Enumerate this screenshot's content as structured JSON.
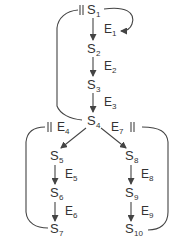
{
  "diagram": {
    "colors": {
      "stroke": "#444444",
      "text": "#333333",
      "background": "#ffffff"
    },
    "states": [
      {
        "id": "S1",
        "base": "S",
        "sub": "1",
        "x": 87,
        "y": 14
      },
      {
        "id": "S2",
        "base": "S",
        "sub": "2",
        "x": 87,
        "y": 53
      },
      {
        "id": "S3",
        "base": "S",
        "sub": "3",
        "x": 87,
        "y": 89
      },
      {
        "id": "S4",
        "base": "S",
        "sub": "4",
        "x": 87,
        "y": 125
      },
      {
        "id": "S5",
        "base": "S",
        "sub": "5",
        "x": 50,
        "y": 160
      },
      {
        "id": "S6",
        "base": "S",
        "sub": "6",
        "x": 50,
        "y": 197
      },
      {
        "id": "S7",
        "base": "S",
        "sub": "7",
        "x": 50,
        "y": 233
      },
      {
        "id": "S8",
        "base": "S",
        "sub": "8",
        "x": 125,
        "y": 160
      },
      {
        "id": "S9",
        "base": "S",
        "sub": "9",
        "x": 125,
        "y": 197
      },
      {
        "id": "S10",
        "base": "S",
        "sub": "10",
        "x": 125,
        "y": 233
      }
    ],
    "events": [
      {
        "id": "E1",
        "base": "E",
        "sub": "1",
        "x": 104,
        "y": 33
      },
      {
        "id": "E2",
        "base": "E",
        "sub": "2",
        "x": 104,
        "y": 70
      },
      {
        "id": "E3",
        "base": "E",
        "sub": "3",
        "x": 104,
        "y": 106
      },
      {
        "id": "E4",
        "base": "E",
        "sub": "4",
        "x": 57,
        "y": 131
      },
      {
        "id": "E5",
        "base": "E",
        "sub": "5",
        "x": 65,
        "y": 178
      },
      {
        "id": "E6",
        "base": "E",
        "sub": "6",
        "x": 65,
        "y": 215
      },
      {
        "id": "E7",
        "base": "E",
        "sub": "7",
        "x": 111,
        "y": 131
      },
      {
        "id": "E8",
        "base": "E",
        "sub": "8",
        "x": 141,
        "y": 178
      },
      {
        "id": "E9",
        "base": "E",
        "sub": "9",
        "x": 141,
        "y": 215
      }
    ],
    "transitions": [
      {
        "from": "S1",
        "to": "S2",
        "event": "E1"
      },
      {
        "from": "S1",
        "to": "S1",
        "event": "E1",
        "type": "self-loop"
      },
      {
        "from": "S2",
        "to": "S3",
        "event": "E2"
      },
      {
        "from": "S3",
        "to": "S4",
        "event": "E3"
      },
      {
        "from": "S4",
        "to": "S1",
        "type": "return-loop"
      },
      {
        "from": "S4",
        "to": "S5",
        "event": "E4"
      },
      {
        "from": "S4",
        "to": "S8",
        "event": "E7"
      },
      {
        "from": "S5",
        "to": "S6",
        "event": "E5"
      },
      {
        "from": "S6",
        "to": "S7",
        "event": "E6"
      },
      {
        "from": "S7",
        "to": "E4",
        "type": "return-loop"
      },
      {
        "from": "S8",
        "to": "S9",
        "event": "E8"
      },
      {
        "from": "S9",
        "to": "S10",
        "event": "E9"
      },
      {
        "from": "S10",
        "to": "E7",
        "type": "return-loop"
      }
    ],
    "barrier_symbol": "||"
  }
}
